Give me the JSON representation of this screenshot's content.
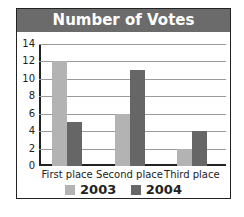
{
  "chart_data": {
    "type": "bar",
    "title": "Number of Votes",
    "categories": [
      "First place",
      "Second place",
      "Third place"
    ],
    "series": [
      {
        "name": "2003",
        "values": [
          12,
          6,
          2
        ],
        "color": "#b3b3b3"
      },
      {
        "name": "2004",
        "values": [
          5,
          11,
          4
        ],
        "color": "#666666"
      }
    ],
    "xlabel": "",
    "ylabel": "",
    "ylim": [
      0,
      14
    ],
    "yticks": [
      "0",
      "2",
      "4",
      "6",
      "8",
      "10",
      "12",
      "14"
    ],
    "grid": true,
    "legend_position": "bottom"
  }
}
